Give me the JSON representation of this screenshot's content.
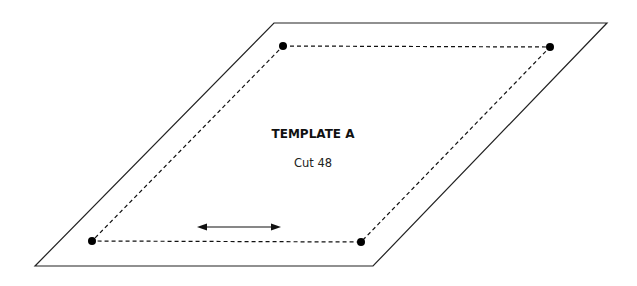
{
  "diagram": {
    "title": "TEMPLATE A",
    "subtitle": "Cut 48",
    "outer_shape": {
      "type": "parallelogram",
      "corners": [
        [
          274,
          23
        ],
        [
          607,
          23
        ],
        [
          373,
          266
        ],
        [
          35,
          266
        ]
      ],
      "stroke": "#222222"
    },
    "inner_dashed_shape": {
      "type": "parallelogram",
      "line_style": "dashed",
      "corners": [
        [
          283,
          46
        ],
        [
          550,
          47
        ],
        [
          361,
          242
        ],
        [
          92,
          241
        ]
      ]
    },
    "corner_markers": [
      {
        "name": "top-left",
        "x": 283,
        "y": 46
      },
      {
        "name": "top-right",
        "x": 550,
        "y": 47
      },
      {
        "name": "bottom-right",
        "x": 361,
        "y": 242
      },
      {
        "name": "bottom-left",
        "x": 92,
        "y": 241
      }
    ],
    "grain_arrow": {
      "type": "double-headed",
      "x1": 198,
      "y1": 227,
      "x2": 280,
      "y2": 227
    }
  }
}
